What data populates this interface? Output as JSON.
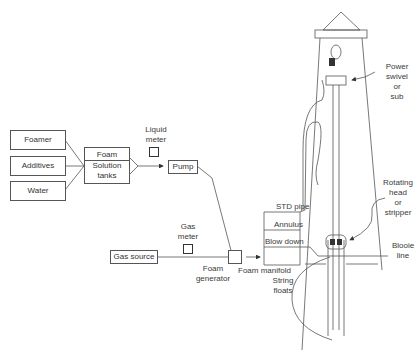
{
  "diagram": {
    "type": "foam drilling system schematic",
    "supply_boxes": [
      {
        "label": "Foamer"
      },
      {
        "label": "Additives"
      },
      {
        "label": "Water"
      }
    ],
    "tank": {
      "line1": "Foam",
      "line2": "Solution",
      "line3": "tanks"
    },
    "liquid_meter": {
      "line1": "Liquid",
      "line2": "meter"
    },
    "pump": {
      "label": "Pump"
    },
    "gas_meter": {
      "line1": "Gas",
      "line2": "meter"
    },
    "gas_source": {
      "label": "Gas source"
    },
    "foam_generator": {
      "line1": "Foam",
      "line2": "generator"
    },
    "manifold": {
      "label": "Foam manifold",
      "lines": [
        {
          "label": "STD pipe"
        },
        {
          "label": "Annulus"
        },
        {
          "label": "Blow down"
        }
      ]
    },
    "power_swivel": {
      "line1": "Power",
      "line2": "swivel",
      "line3": "or",
      "line4": "sub"
    },
    "rotating_head": {
      "line1": "Rotating",
      "line2": "head",
      "line3": "or",
      "line4": "stripper"
    },
    "blooie_line": {
      "line1": "Blooie",
      "line2": "line"
    },
    "string_floats": {
      "line1": "String",
      "line2": "floats"
    }
  }
}
